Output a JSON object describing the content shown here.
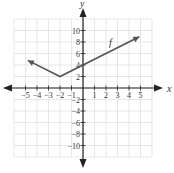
{
  "chart_data": {
    "type": "line",
    "title": "",
    "xlabel": "x",
    "ylabel": "y",
    "xlim": [
      -6,
      6
    ],
    "ylim": [
      -12,
      12
    ],
    "x_ticks": [
      -5,
      -4,
      -3,
      -2,
      -1,
      1,
      2,
      3,
      4,
      5
    ],
    "y_ticks": [
      -10,
      -8,
      -6,
      -4,
      -2,
      2,
      4,
      6,
      8,
      10
    ],
    "grid": true,
    "series": [
      {
        "name": "f",
        "formula": "f(x) = |x + 2| + 2",
        "points": [
          [
            -4.8,
            4.8
          ],
          [
            -2,
            2
          ],
          [
            4.9,
            8.9
          ]
        ],
        "arrows_both_ends": true,
        "vertex": [
          -2,
          2
        ],
        "y_intercept": 4
      }
    ],
    "annotations": [
      {
        "text": "f",
        "x": 2.3,
        "y": 7.8
      }
    ]
  },
  "labels": {
    "x_axis": "x",
    "y_axis": "y",
    "curve": "f"
  },
  "colors": {
    "grid": "#dcdcdc",
    "axis": "#222222",
    "curve": "#555555"
  }
}
